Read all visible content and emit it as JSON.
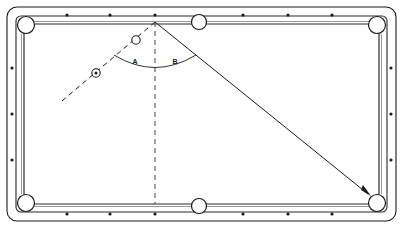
{
  "figure": {
    "background_color": "#ffffff",
    "ink_color": "#1a1a1a",
    "rail_color": "#2b2b2b"
  },
  "table": {
    "outer_cushion_label": "table-outline",
    "bed_label": "table-bed",
    "rail_label": "rail-cushion",
    "outline": {
      "x": 7,
      "y": 7,
      "width": 389,
      "height": 214,
      "corner_radius": 9
    },
    "inner_rail": {
      "x": 16,
      "y": 16,
      "width": 371,
      "height": 196,
      "corner_radius": 4
    },
    "playfield": {
      "x": 24,
      "y": 24,
      "width": 355,
      "height": 180
    }
  },
  "pockets": [
    {
      "name": "pocket-top-left",
      "cx": 26,
      "cy": 25,
      "r": 8.5,
      "type": "corner"
    },
    {
      "name": "pocket-top-middle",
      "cx": 199,
      "cy": 22,
      "r": 7.5,
      "type": "side"
    },
    {
      "name": "pocket-top-right",
      "cx": 377,
      "cy": 25,
      "r": 8.5,
      "type": "corner"
    },
    {
      "name": "pocket-bottom-left",
      "cx": 26,
      "cy": 203,
      "r": 8.5,
      "type": "corner"
    },
    {
      "name": "pocket-bottom-middle",
      "cx": 199,
      "cy": 206,
      "r": 7.5,
      "type": "side"
    },
    {
      "name": "pocket-bottom-right",
      "cx": 377,
      "cy": 203,
      "r": 8.5,
      "type": "corner"
    }
  ],
  "rail_markers": {
    "description": "diamond sight dots on the rails",
    "dot_radius": 1.6,
    "top": [
      {
        "cx": 67,
        "cy": 15
      },
      {
        "cx": 110,
        "cy": 15
      },
      {
        "cx": 155,
        "cy": 15
      },
      {
        "cx": 243,
        "cy": 15
      },
      {
        "cx": 288,
        "cy": 15
      },
      {
        "cx": 332,
        "cy": 15
      }
    ],
    "bottom": [
      {
        "cx": 67,
        "cy": 214
      },
      {
        "cx": 110,
        "cy": 214
      },
      {
        "cx": 155,
        "cy": 214
      },
      {
        "cx": 243,
        "cy": 214
      },
      {
        "cx": 288,
        "cy": 214
      },
      {
        "cx": 332,
        "cy": 214
      }
    ],
    "left": [
      {
        "cx": 12,
        "cy": 68
      },
      {
        "cx": 12,
        "cy": 114
      },
      {
        "cx": 12,
        "cy": 160
      }
    ],
    "right": [
      {
        "cx": 391,
        "cy": 68
      },
      {
        "cx": 391,
        "cy": 114
      },
      {
        "cx": 391,
        "cy": 160
      }
    ]
  },
  "balls": [
    {
      "name": "cue-ball",
      "style": "circle-with-center-dot",
      "cx": 96,
      "cy": 73,
      "r": 4.2,
      "dot_r": 1.5
    },
    {
      "name": "object-ball",
      "style": "open-circle",
      "cx": 136,
      "cy": 40,
      "r": 4.2
    }
  ],
  "geometry": {
    "contact_point": {
      "x": 155,
      "y": 22,
      "label": "cushion-contact-point"
    },
    "incoming_path": {
      "name": "incoming-shot-line",
      "style": "dashed",
      "from": {
        "x": 62,
        "y": 101
      },
      "to": {
        "x": 155,
        "y": 22
      },
      "dash_pattern": "5,4"
    },
    "normal_line": {
      "name": "perpendicular-normal-line",
      "style": "dashed",
      "from": {
        "x": 155,
        "y": 22
      },
      "to": {
        "x": 155,
        "y": 204
      },
      "dash_pattern": "5,4"
    },
    "outgoing_path": {
      "name": "rebound-shot-line",
      "style": "solid-with-arrow",
      "from": {
        "x": 155,
        "y": 22
      },
      "to": {
        "x": 371,
        "y": 196
      },
      "arrow": true
    },
    "angle_arc": {
      "name": "angle-arc",
      "radius": 52,
      "start": {
        "x": 114,
        "y": 54
      },
      "end": {
        "x": 196,
        "y": 54
      },
      "sweep_through": {
        "x": 155,
        "y": 74
      }
    }
  },
  "labels": {
    "angle_a": {
      "text": "A",
      "x": 135,
      "y": 62,
      "meaning": "angle of incidence"
    },
    "angle_b": {
      "text": "B",
      "x": 174,
      "y": 62,
      "meaning": "angle of reflection"
    }
  }
}
